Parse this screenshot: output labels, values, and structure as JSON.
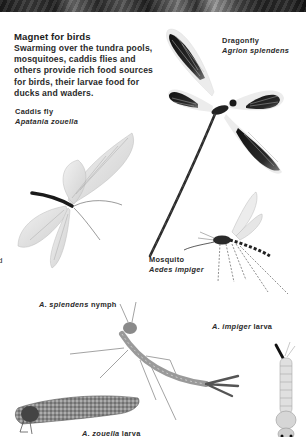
{
  "page": {
    "photo_strip": "dark-photograph-top-edge"
  },
  "intro": {
    "title": "Magnet for birds",
    "body": "Swarming over the tundra pools, mosquitoes, caddis flies and others provide rich food sources for birds, their larvae food for ducks and waders."
  },
  "labels": {
    "dragonfly": {
      "common": "Dragonfly",
      "latin": "Agrion splendens"
    },
    "caddis_fly": {
      "common": "Caddis fly",
      "latin": "Apatania zouella"
    },
    "mosquito": {
      "common": "Mosquito",
      "latin": "Aedes impiger"
    },
    "nymph": {
      "latin": "A. splendens",
      "suffix": " nymph"
    },
    "mosquito_larva": {
      "latin": "A. impiger",
      "suffix": " larva"
    },
    "caddis_larva": {
      "latin": "A. zouella",
      "suffix": " larva"
    }
  },
  "edge_fragment": "d",
  "illustrations": [
    "dragonfly-illustration",
    "caddis-fly-illustration",
    "mosquito-illustration",
    "dragonfly-nymph-illustration",
    "mosquito-larva-illustration",
    "caddis-larva-case-illustration"
  ]
}
